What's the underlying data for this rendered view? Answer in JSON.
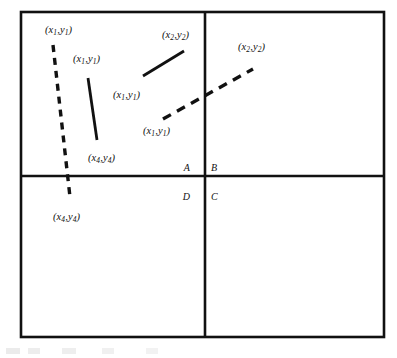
{
  "figure": {
    "title": "",
    "background_color": "#ffffff",
    "stroke_color": "#111111",
    "frame": {
      "x": 21,
      "y": 12,
      "width": 363,
      "height": 325,
      "border_width": 2.6,
      "divider_x": 205,
      "divider_y": 176,
      "divider_width": 2.6
    },
    "quadrant_labels": [
      {
        "name": "quadrant-a",
        "text": "A",
        "x": 190,
        "y": 163,
        "align": "right"
      },
      {
        "name": "quadrant-b",
        "text": "B",
        "x": 211,
        "y": 163,
        "align": "left"
      },
      {
        "name": "quadrant-d",
        "text": "D",
        "x": 190,
        "y": 192,
        "align": "right"
      },
      {
        "name": "quadrant-c",
        "text": "C",
        "x": 211,
        "y": 192,
        "align": "left"
      }
    ],
    "segments": [
      {
        "name": "dashed-vertical-segment",
        "style": "dashed",
        "x1": 53,
        "y1": 45,
        "x2": 70,
        "y2": 197,
        "stroke_width": 3.4,
        "dash": "7 6"
      },
      {
        "name": "solid-vertical-segment",
        "style": "solid",
        "x1": 88,
        "y1": 78,
        "x2": 97,
        "y2": 140,
        "stroke_width": 2.8
      },
      {
        "name": "solid-diagonal-segment",
        "style": "solid",
        "x1": 143,
        "y1": 76,
        "x2": 184,
        "y2": 51,
        "stroke_width": 2.8
      },
      {
        "name": "dashed-diagonal-segment",
        "style": "dashed",
        "x1": 163,
        "y1": 119,
        "x2": 253,
        "y2": 69,
        "stroke_width": 3.4,
        "dash": "9 7"
      }
    ],
    "point_labels": [
      {
        "name": "label-dashed-vertical-start",
        "var_x": "x",
        "sub_x": "1",
        "var_y": "y",
        "sub_y": "1",
        "text": "(x1,y1)",
        "x": 45,
        "y": 25
      },
      {
        "name": "label-solid-vertical-start",
        "var_x": "x",
        "sub_x": "1",
        "var_y": "y",
        "sub_y": "1",
        "text": "(x1,y1)",
        "x": 73,
        "y": 54
      },
      {
        "name": "label-solid-diagonal-end",
        "var_x": "x",
        "sub_x": "2",
        "var_y": "y",
        "sub_y": "2",
        "text": "(x2,y2)",
        "x": 162,
        "y": 30
      },
      {
        "name": "label-dashed-diagonal-end",
        "var_x": "x",
        "sub_x": "2",
        "var_y": "y",
        "sub_y": "2",
        "text": "(x2,y2)",
        "x": 238,
        "y": 42
      },
      {
        "name": "label-solid-diagonal-start",
        "var_x": "x",
        "sub_x": "1",
        "var_y": "y",
        "sub_y": "1",
        "text": "(x1,y1)",
        "x": 113,
        "y": 90
      },
      {
        "name": "label-dashed-diagonal-start",
        "var_x": "x",
        "sub_x": "1",
        "var_y": "y",
        "sub_y": "1",
        "text": "(x1,y1)",
        "x": 143,
        "y": 126
      },
      {
        "name": "label-solid-vertical-end",
        "var_x": "x",
        "sub_x": "4",
        "var_y": "y",
        "sub_y": "4",
        "text": "(x4,y4)",
        "x": 88,
        "y": 153
      },
      {
        "name": "label-dashed-vertical-end",
        "var_x": "x",
        "sub_x": "4",
        "var_y": "y",
        "sub_y": "4",
        "text": "(x4,y4)",
        "x": 53,
        "y": 212
      }
    ]
  }
}
